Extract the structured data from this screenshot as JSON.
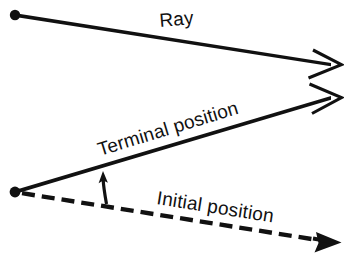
{
  "figure": {
    "name": "ray-and-angle-diagram",
    "width": 344,
    "height": 274,
    "background_color": "#ffffff",
    "ink_color": "#111111"
  },
  "labels": {
    "ray": "Ray",
    "terminal_position": "Terminal position",
    "initial_position": "Initial position"
  },
  "elements": {
    "ray": {
      "name": "ray",
      "style": "solid",
      "endpoint_dot": true,
      "arrowhead": "open",
      "from": [
        15,
        15
      ],
      "to": [
        340,
        65
      ],
      "label_rotation_deg": -5
    },
    "terminal_side": {
      "name": "terminal-position-ray",
      "style": "solid",
      "endpoint_dot": true,
      "arrowhead": "open",
      "from": [
        16,
        192
      ],
      "to": [
        340,
        98
      ],
      "label_rotation_deg": -17
    },
    "initial_side": {
      "name": "initial-position-ray",
      "style": "dashed",
      "endpoint_dot": true,
      "arrowhead": "solid",
      "from": [
        18,
        192
      ],
      "to": [
        340,
        243
      ],
      "label_rotation_deg": 9,
      "dash_pattern": "13 7"
    },
    "angle_arrow": {
      "name": "angle-rotation-arrow",
      "style": "solid",
      "arrowhead": "solid",
      "from": [
        106,
        203
      ],
      "to": [
        103,
        173
      ],
      "direction": "counterclockwise-up"
    }
  },
  "label_positions": {
    "ray": {
      "x": 160,
      "y": 27,
      "font_size": 19
    },
    "terminal_position": {
      "x": 100,
      "y": 155,
      "font_size": 19
    },
    "initial_position": {
      "x": 156,
      "y": 205,
      "font_size": 19
    }
  }
}
